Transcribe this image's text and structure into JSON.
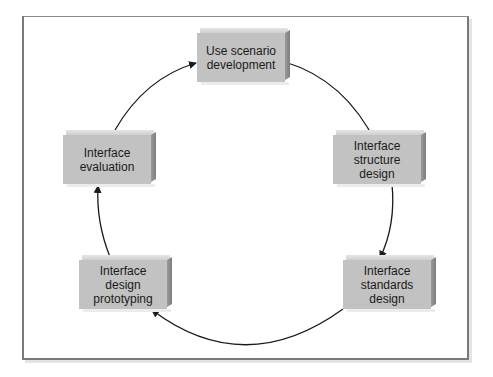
{
  "diagram": {
    "type": "cycle",
    "nodes": [
      {
        "id": "use-scenario",
        "label": "Use scenario\ndevelopment",
        "x": 197,
        "y": 28
      },
      {
        "id": "structure",
        "label": "Interface\nstructure\ndesign",
        "x": 333,
        "y": 130
      },
      {
        "id": "standards",
        "label": "Interface\nstandards\ndesign",
        "x": 343,
        "y": 255
      },
      {
        "id": "prototyping",
        "label": "Interface\ndesign\nprototyping",
        "x": 79,
        "y": 255
      },
      {
        "id": "evaluation",
        "label": "Interface\nevaluation",
        "x": 63,
        "y": 130
      }
    ],
    "edges": [
      {
        "from": "use-scenario",
        "to": "structure"
      },
      {
        "from": "structure",
        "to": "standards"
      },
      {
        "from": "standards",
        "to": "prototyping"
      },
      {
        "from": "prototyping",
        "to": "evaluation"
      },
      {
        "from": "evaluation",
        "to": "use-scenario"
      }
    ],
    "colors": {
      "box_face": "#c2c2c2",
      "box_side": "#8a8a8a",
      "arrow": "#1a1a1a",
      "frame": "#7a7a7a"
    }
  }
}
